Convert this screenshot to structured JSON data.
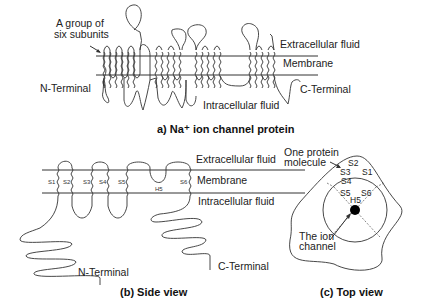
{
  "panel_a": {
    "caption": "a) Na⁺ ion channel protein",
    "labels": {
      "group": "A group of",
      "group2": "six subunits",
      "extracellular": "Extracellular fluid",
      "membrane": "Membrane",
      "intracellular": "Intracellular fluid",
      "n_terminal": "N-Terminal",
      "c_terminal": "C-Terminal"
    }
  },
  "panel_b": {
    "caption": "(b) Side view",
    "labels": {
      "extracellular": "Extracellular fluid",
      "membrane": "Membrane",
      "intracellular": "Intracellular fluid",
      "n_terminal": "N-Terminal",
      "c_terminal": "C-Terminal"
    },
    "segments": [
      "S1",
      "S2",
      "S3",
      "S4",
      "S5",
      "H5",
      "S6"
    ]
  },
  "panel_c": {
    "caption": "(c) Top view",
    "labels": {
      "molecule": "One protein",
      "molecule2": "molecule",
      "channel": "The ion",
      "channel2": "channel"
    },
    "segments": [
      "S2",
      "S3",
      "S1",
      "S4",
      "S5",
      "S6",
      "H5"
    ]
  }
}
